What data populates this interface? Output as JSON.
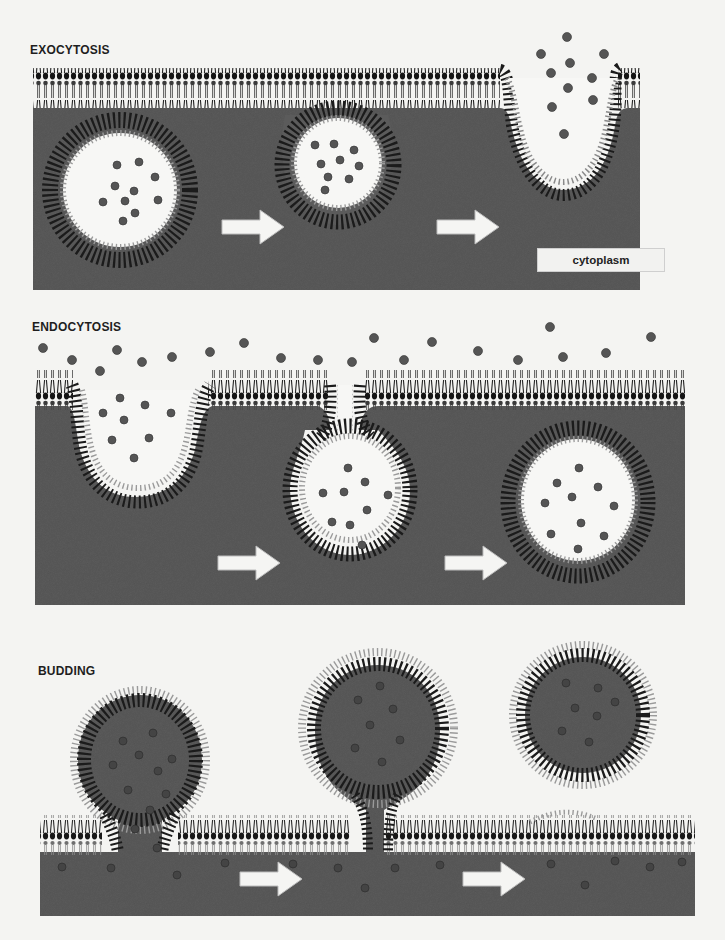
{
  "figure": {
    "panels": [
      {
        "id": "exocytosis",
        "label": "EXOCYTOSIS",
        "steps": 3,
        "arrows": 2,
        "annotation": "cytoplasm"
      },
      {
        "id": "endocytosis",
        "label": "ENDOCYTOSIS",
        "steps": 3,
        "arrows": 2
      },
      {
        "id": "budding",
        "label": "BUDDING",
        "steps": 3,
        "arrows": 2
      }
    ],
    "colors": {
      "background": "#f4f4f2",
      "cytoplasm": "#5b5b5b",
      "lipid_head_dark": "#1c1c1c",
      "lipid_head_light": "#8a8a8a",
      "vesicle_interior": "#f7f7f5",
      "cargo_particle": "#555555",
      "arrow_fill": "#f5f5f3"
    }
  }
}
